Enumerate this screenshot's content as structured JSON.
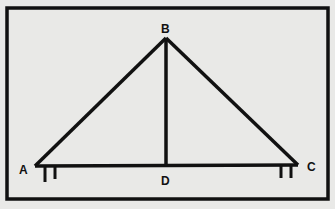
{
  "diagram": {
    "type": "truss",
    "colors": {
      "background": "#e9e9e7",
      "ink": "#111111"
    },
    "points": {
      "A": {
        "label": "A",
        "x": 35,
        "y": 166
      },
      "B": {
        "label": "B",
        "x": 166,
        "y": 38
      },
      "C": {
        "label": "C",
        "x": 298,
        "y": 165
      },
      "D": {
        "label": "D",
        "x": 166,
        "y": 165
      }
    },
    "members": [
      "AB",
      "BC",
      "AC",
      "BD"
    ],
    "supports": [
      "A",
      "C"
    ]
  }
}
